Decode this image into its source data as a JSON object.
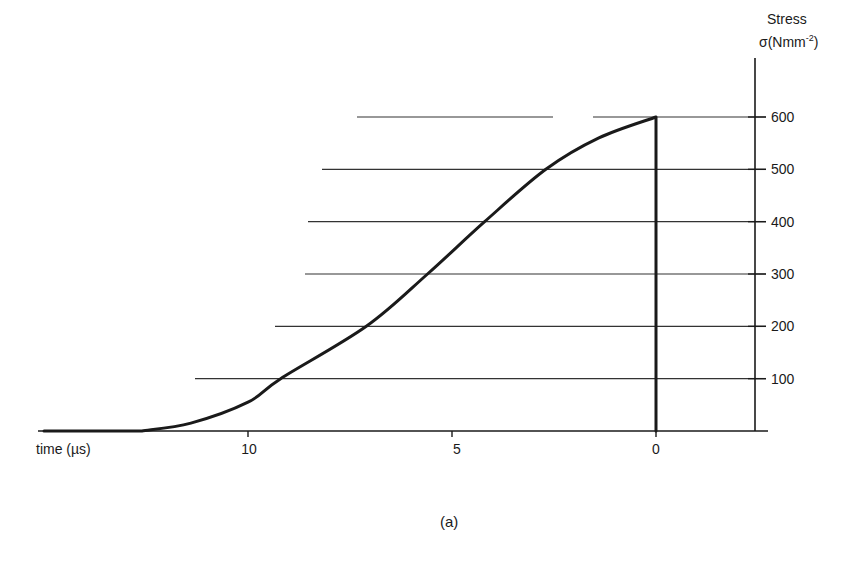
{
  "chart_data": {
    "type": "line",
    "title": "",
    "caption": "(a)",
    "xlabel": "time (µs)",
    "ylabel_line1": "Stress",
    "ylabel_line2": "σ(Nmm⁻²)",
    "x_direction": "reversed",
    "xlim": [
      15,
      -2.5
    ],
    "ylim": [
      0,
      600
    ],
    "x_ticks": [
      10,
      5,
      0
    ],
    "y_ticks": [
      100,
      200,
      300,
      400,
      500,
      600
    ],
    "grid": "horizontal partial lines at y ticks",
    "series": [
      {
        "name": "stress",
        "x": [
          15,
          12.6,
          11.4,
          10,
          9.2,
          7.1,
          5.6,
          4.2,
          2.7,
          1.4,
          0,
          0
        ],
        "y": [
          0,
          0,
          15,
          55,
          100,
          200,
          300,
          400,
          500,
          560,
          600,
          0
        ]
      }
    ]
  },
  "axis": {
    "y_ticks": [
      "100",
      "200",
      "300",
      "400",
      "500",
      "600"
    ],
    "x_ticks": [
      "10",
      "5",
      "0"
    ]
  },
  "labels": {
    "xlabel": "time (µs)",
    "ylabel_1": "Stress",
    "ylabel_2_base": "σ(Nmm",
    "ylabel_2_sup": "-2",
    "ylabel_2_close": ")",
    "caption": "(a)"
  },
  "style": {
    "ink": "#1a1a1a",
    "grid": "#333333",
    "background": "#ffffff"
  }
}
